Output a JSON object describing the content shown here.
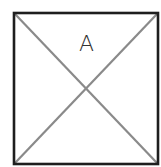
{
  "diagram": {
    "label": "A",
    "colors": {
      "background": "#ffffff",
      "frame": "#1e1e1e",
      "diagonals": "#8a8a8a",
      "label": "#333333"
    },
    "box": {
      "x": 14,
      "y": 13,
      "width": 144,
      "height": 151
    }
  }
}
